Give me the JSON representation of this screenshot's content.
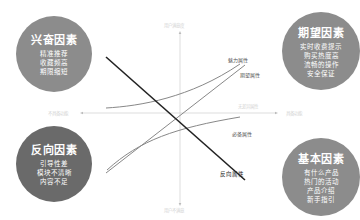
{
  "diagram": {
    "type": "kano-model",
    "axes": {
      "top": "用户满意度",
      "bottom": "用户不满意",
      "left": "不具备功能",
      "right": "具备功能",
      "center_right": "无差异属性"
    },
    "curve_labels": {
      "attractive": "魅力属性",
      "performance": "期望属性",
      "must_be": "必备属性",
      "reverse": "反向属性"
    },
    "quadrants": [
      {
        "id": "excitement",
        "title": "兴奋因素",
        "lines": [
          "精准推荐",
          "收藏频高",
          "期限缩短"
        ],
        "color": "#8c8c8c"
      },
      {
        "id": "expectation",
        "title": "期望因素",
        "lines": [
          "实时收费提示",
          "购买热度高",
          "流畅的操作",
          "安全保证"
        ],
        "color": "#8c8c8c"
      },
      {
        "id": "reverse",
        "title": "反向因素",
        "lines": [
          "引导性差",
          "模块不清晰",
          "内容不足"
        ],
        "color": "#6a6a6a"
      },
      {
        "id": "basic",
        "title": "基本因素",
        "lines": [
          "有什么产品",
          "热门的活动",
          "产品介绍",
          "新手指引"
        ],
        "color": "#8c8c8c"
      }
    ],
    "colors": {
      "axis": "#cccccc",
      "curve": "#777777",
      "reverse_line": "#222222"
    }
  }
}
